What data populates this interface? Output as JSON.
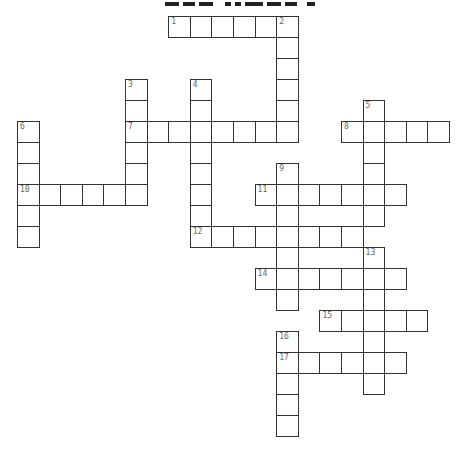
{
  "puzzle": {
    "title": "",
    "grid": {
      "origin_x": 17,
      "origin_y": 16,
      "cell_w": 21.6,
      "cell_h": 21,
      "border_color": "#333333",
      "number_color": "#666666"
    },
    "words": [
      {
        "number": "1",
        "direction": "across",
        "row": 0,
        "col": 7,
        "length": 6
      },
      {
        "number": "2",
        "direction": "down",
        "row": 0,
        "col": 12,
        "length": 6
      },
      {
        "number": "3",
        "direction": "down",
        "row": 3,
        "col": 5,
        "length": 6
      },
      {
        "number": "4",
        "direction": "down",
        "row": 3,
        "col": 8,
        "length": 8
      },
      {
        "number": "5",
        "direction": "down",
        "row": 4,
        "col": 16,
        "length": 6
      },
      {
        "number": "6",
        "direction": "down",
        "row": 5,
        "col": 0,
        "length": 6
      },
      {
        "number": "7",
        "direction": "across",
        "row": 5,
        "col": 5,
        "length": 8
      },
      {
        "number": "8",
        "direction": "across",
        "row": 5,
        "col": 15,
        "length": 5
      },
      {
        "number": "9",
        "direction": "down",
        "row": 7,
        "col": 12,
        "length": 7
      },
      {
        "number": "10",
        "direction": "across",
        "row": 8,
        "col": 0,
        "length": 6
      },
      {
        "number": "11",
        "direction": "across",
        "row": 8,
        "col": 11,
        "length": 7
      },
      {
        "number": "12",
        "direction": "across",
        "row": 10,
        "col": 8,
        "length": 8
      },
      {
        "number": "13",
        "direction": "down",
        "row": 11,
        "col": 16,
        "length": 7
      },
      {
        "number": "14",
        "direction": "across",
        "row": 12,
        "col": 11,
        "length": 7
      },
      {
        "number": "15",
        "direction": "across",
        "row": 14,
        "col": 14,
        "length": 5
      },
      {
        "number": "16",
        "direction": "down",
        "row": 15,
        "col": 12,
        "length": 5
      },
      {
        "number": "17",
        "direction": "across",
        "row": 16,
        "col": 12,
        "length": 6
      }
    ]
  }
}
